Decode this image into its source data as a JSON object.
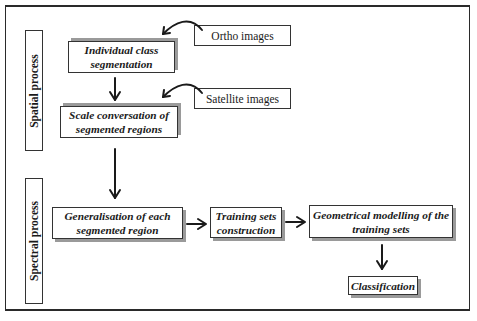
{
  "diagram": {
    "side_labels": {
      "spatial": "Spatial process",
      "spectral": "Spectral process"
    },
    "inputs": {
      "ortho": "Ortho images",
      "satellite": "Satellite images"
    },
    "steps": {
      "individual_line1": "Individual class",
      "individual_line2": "segmentation",
      "scale_line1": "Scale conversation of",
      "scale_line2": "segmented regions",
      "generalisation_line1": "Generalisation of each",
      "generalisation_line2": "segmented region",
      "training_line1": "Training sets",
      "training_line2": "construction",
      "geometrical_line1": "Geometrical modelling of the",
      "geometrical_line2": "training sets",
      "classification": "Classification"
    },
    "colors": {
      "stroke": "#1a1a1a",
      "shadow": "#9a9a9a",
      "background": "#ffffff"
    }
  }
}
